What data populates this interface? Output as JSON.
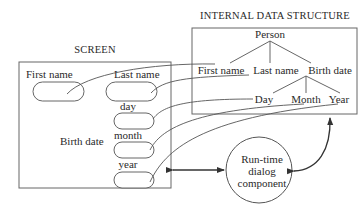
{
  "screen": {
    "title": "SCREEN",
    "fields": [
      {
        "label": "First name"
      },
      {
        "label": "Last name"
      },
      {
        "label": "day"
      },
      {
        "label": "month"
      },
      {
        "label": "year"
      }
    ],
    "group_label": "Birth date"
  },
  "internal": {
    "title": "INTERNAL DATA STRUCTURE",
    "root": "Person",
    "level1": [
      "First name",
      "Last name",
      "Birth date"
    ],
    "level2": [
      "Day",
      "Month",
      "Year"
    ]
  },
  "dialog": {
    "lines": [
      "Run-time",
      "dialog",
      "component"
    ]
  },
  "colors": {
    "line": "#555555",
    "box": "#666666",
    "text": "#2a2a2a"
  }
}
